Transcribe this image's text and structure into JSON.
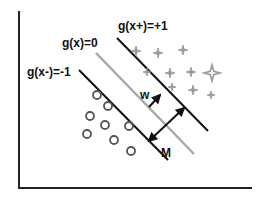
{
  "diagram": {
    "labels": {
      "positive_margin": "g(x+)=+1",
      "decision_boundary": "g(x)=0",
      "negative_margin": "g(x-)=-1",
      "weight_vector": "w",
      "margin": "M"
    },
    "classes": [
      {
        "name": "positive",
        "marker": "four-point-star",
        "count": 10
      },
      {
        "name": "negative",
        "marker": "circle",
        "count": 8
      }
    ],
    "colors": {
      "axis": "#222222",
      "margin_line": "#111111",
      "boundary_line": "#a8a8a8",
      "positive_marker": "#999999",
      "negative_marker": "#555555",
      "arrow": "#111111"
    }
  }
}
